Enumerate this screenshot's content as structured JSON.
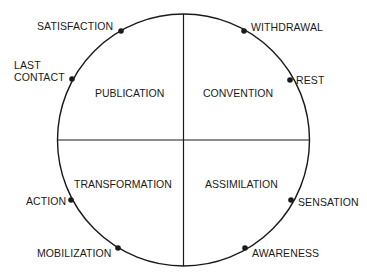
{
  "diagram": {
    "type": "cycle-wheel",
    "quadrants": {
      "top_left": "PUBLICATION",
      "top_right": "CONVENTION",
      "bottom_left": "TRANSFORMATION",
      "bottom_right": "ASSIMILATION"
    },
    "points": {
      "satisfaction": "SATISFACTION",
      "last_contact_line1": "LAST",
      "last_contact_line2": "CONTACT",
      "withdrawal": "WITHDRAWAL",
      "rest": "REST",
      "action": "ACTION",
      "mobilization": "MOBILIZATION",
      "sensation": "SENSATION",
      "awareness": "AWARENESS"
    },
    "colors": {
      "line": "#1a1a1a",
      "background": "#ffffff"
    }
  }
}
